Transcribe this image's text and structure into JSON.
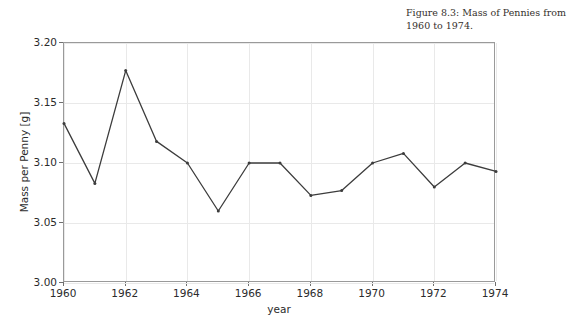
{
  "caption": {
    "text": "Figure 8.3: Mass of Pennies from 1960 to 1974."
  },
  "chart_data": {
    "type": "line",
    "title": "",
    "xlabel": "year",
    "ylabel": "Mass per Penny [g]",
    "x": [
      1960,
      1961,
      1962,
      1963,
      1964,
      1965,
      1966,
      1967,
      1968,
      1969,
      1970,
      1971,
      1972,
      1973,
      1974
    ],
    "values": [
      3.133,
      3.083,
      3.177,
      3.118,
      3.1,
      3.06,
      3.1,
      3.1,
      3.073,
      3.077,
      3.1,
      3.108,
      3.08,
      3.1,
      3.093
    ],
    "series": [
      {
        "name": "Mass per Penny",
        "values": [
          3.133,
          3.083,
          3.177,
          3.118,
          3.1,
          3.06,
          3.1,
          3.1,
          3.073,
          3.077,
          3.1,
          3.108,
          3.08,
          3.1,
          3.093
        ]
      }
    ],
    "xlim": [
      1960,
      1974
    ],
    "ylim": [
      3.0,
      3.2
    ],
    "xticks": [
      1960,
      1962,
      1964,
      1966,
      1968,
      1970,
      1972,
      1974
    ],
    "xtick_labels": [
      "1960",
      "1962",
      "1964",
      "1966",
      "1968",
      "1970",
      "1972",
      "1974"
    ],
    "yticks": [
      3.0,
      3.05,
      3.1,
      3.15,
      3.2
    ],
    "ytick_labels": [
      "3.00",
      "3.05",
      "3.10",
      "3.15",
      "3.20"
    ],
    "grid": true,
    "legend": null,
    "line_color": "#3c3c3c",
    "marker": "point",
    "frame_color": "#9a9a9a",
    "grid_color": "#e9e9e9",
    "background": "#ffffff"
  }
}
